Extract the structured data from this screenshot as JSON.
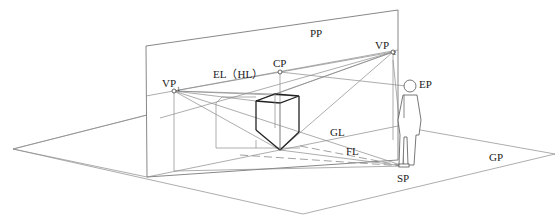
{
  "diagram": {
    "labels": {
      "picture_plane": "PP",
      "vanishing_point": "VP",
      "vp1_sub": "1",
      "vp2_sub": "2",
      "center_point": "CP",
      "eye_level": "EL（HL）",
      "eye_point": "EP",
      "ground_line": "GL",
      "foot_line": "FL",
      "ground_plane": "GP",
      "station_point": "SP"
    },
    "points": {
      "pp_top_left": [
        146,
        46
      ],
      "pp_top_right": [
        398,
        10
      ],
      "pp_bottom_left": [
        147,
        177
      ],
      "pp_bottom_right": [
        398,
        160
      ],
      "vp1": [
        174,
        91
      ],
      "vp2": [
        393,
        52
      ],
      "cp": [
        280,
        72
      ],
      "ep": [
        410,
        86
      ],
      "sp": [
        404,
        166
      ],
      "gp_left": [
        13,
        149
      ],
      "gp_bottom": [
        303,
        214
      ],
      "gp_right": [
        555,
        154
      ],
      "cube_front_bottom": [
        280,
        150
      ]
    },
    "colors": {
      "line": "#8a8a8a",
      "bold_line": "#222222",
      "background": "#ffffff"
    }
  }
}
